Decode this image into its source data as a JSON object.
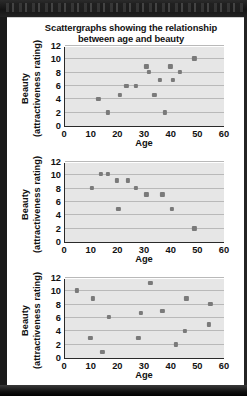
{
  "window": {
    "background_color": "#1b1b1b",
    "page_color": "#ffffff"
  },
  "title": {
    "line1": "Scattergraphs showing the relationship",
    "line2": "between age and beauty"
  },
  "axis_style": {
    "plot_background": "#e6e6e6",
    "gridline_color": "#b9b9b9",
    "axis_color": "#2a2a2a",
    "point_color": "#7a7a7a"
  },
  "chart_data": [
    {
      "type": "scatter",
      "id": "chart-1",
      "title": "Scattergraphs showing the relationship between age and beauty",
      "xlabel": "Age",
      "ylabel": "Beauty (attractiveness rating)",
      "ylabel_line1": "Beauty",
      "ylabel_line2": "(attractiveness rating)",
      "xlim": [
        0,
        60
      ],
      "ylim": [
        0,
        12
      ],
      "xticks": [
        0,
        10,
        20,
        30,
        40,
        50,
        60
      ],
      "yticks": [
        0,
        2,
        4,
        6,
        8,
        10,
        12
      ],
      "grid": true,
      "legend": null,
      "relationship": "positive correlation",
      "points": [
        {
          "x": 12.5,
          "y": 4.0
        },
        {
          "x": 16.0,
          "y": 2.0
        },
        {
          "x": 20.5,
          "y": 4.6
        },
        {
          "x": 23.0,
          "y": 6.0
        },
        {
          "x": 26.5,
          "y": 6.0
        },
        {
          "x": 30.5,
          "y": 8.9
        },
        {
          "x": 31.5,
          "y": 8.1
        },
        {
          "x": 33.5,
          "y": 4.6
        },
        {
          "x": 35.5,
          "y": 6.9
        },
        {
          "x": 37.5,
          "y": 2.0
        },
        {
          "x": 39.5,
          "y": 8.9
        },
        {
          "x": 40.5,
          "y": 6.9
        },
        {
          "x": 43.0,
          "y": 8.1
        },
        {
          "x": 48.5,
          "y": 10.1
        }
      ]
    },
    {
      "type": "scatter",
      "id": "chart-2",
      "xlabel": "Age",
      "ylabel": "Beauty (attractiveness rating)",
      "ylabel_line1": "Beauty",
      "ylabel_line2": "(attractiveness rating)",
      "xlim": [
        0,
        60
      ],
      "ylim": [
        0,
        12
      ],
      "xticks": [
        0,
        10,
        20,
        30,
        40,
        50,
        60
      ],
      "yticks": [
        0,
        2,
        4,
        6,
        8,
        10,
        12
      ],
      "grid": true,
      "legend": null,
      "relationship": "negative correlation",
      "points": [
        {
          "x": 10.0,
          "y": 8.1
        },
        {
          "x": 13.5,
          "y": 10.2
        },
        {
          "x": 16.0,
          "y": 10.2
        },
        {
          "x": 19.5,
          "y": 9.2
        },
        {
          "x": 20.0,
          "y": 4.9
        },
        {
          "x": 23.5,
          "y": 9.2
        },
        {
          "x": 26.5,
          "y": 8.1
        },
        {
          "x": 30.5,
          "y": 7.1
        },
        {
          "x": 36.5,
          "y": 7.1
        },
        {
          "x": 40.0,
          "y": 4.9
        },
        {
          "x": 48.5,
          "y": 2.0
        }
      ]
    },
    {
      "type": "scatter",
      "id": "chart-3",
      "xlabel": "Age",
      "ylabel": "Beauty (attractiveness rating)",
      "ylabel_line1": "Beauty",
      "ylabel_line2": "(attractiveness rating)",
      "xlim": [
        0,
        60
      ],
      "ylim": [
        0,
        12
      ],
      "xticks": [
        0,
        10,
        20,
        30,
        40,
        50,
        60
      ],
      "yticks": [
        0,
        2,
        4,
        6,
        8,
        10,
        12
      ],
      "grid": true,
      "legend": null,
      "relationship": "no correlation",
      "points": [
        {
          "x": 4.5,
          "y": 10.1
        },
        {
          "x": 9.5,
          "y": 3.0
        },
        {
          "x": 10.5,
          "y": 8.9
        },
        {
          "x": 14.0,
          "y": 0.9
        },
        {
          "x": 16.5,
          "y": 6.1
        },
        {
          "x": 27.5,
          "y": 3.0
        },
        {
          "x": 28.5,
          "y": 6.7
        },
        {
          "x": 32.0,
          "y": 11.2
        },
        {
          "x": 36.5,
          "y": 7.0
        },
        {
          "x": 41.5,
          "y": 2.0
        },
        {
          "x": 45.0,
          "y": 4.0
        },
        {
          "x": 45.5,
          "y": 8.9
        },
        {
          "x": 54.0,
          "y": 5.0
        },
        {
          "x": 54.5,
          "y": 8.1
        }
      ]
    }
  ]
}
